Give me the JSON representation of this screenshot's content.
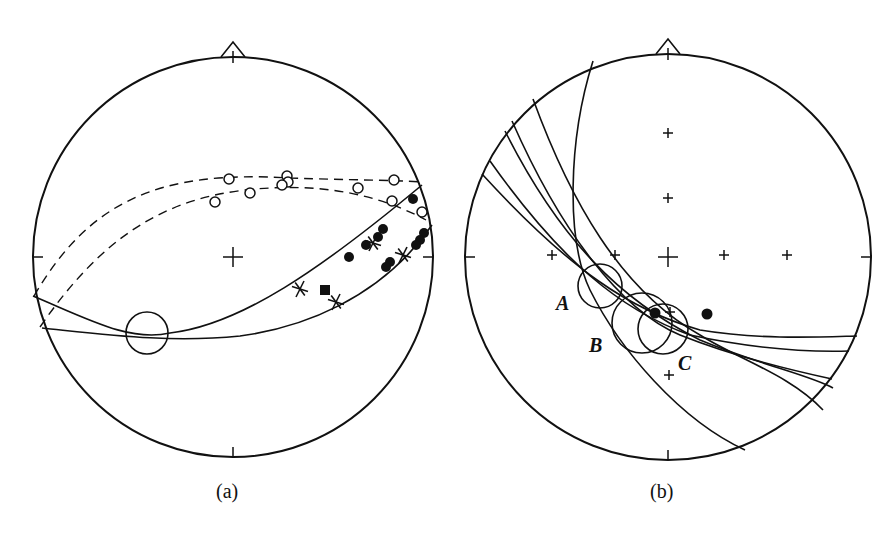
{
  "figure": {
    "panels": [
      {
        "id": "a",
        "caption": "(a)",
        "center": [
          233,
          257
        ],
        "radius": 200,
        "ink": "#111111",
        "dashed_great_circles": [
          "M 34 296 C 90 200, 160 170, 290 178 C 350 180, 390 180, 422 182",
          "M 40 327 C 100 240, 160 200, 245 190 C 310 183, 370 190, 426 220"
        ],
        "solid_great_circles": [
          "M 33 296 C 90 320, 130 342, 170 333 C 240 325, 320 270, 422 185",
          "M 42 328 C 110 335, 170 343, 240 336 C 300 328, 380 300, 432 225"
        ],
        "open_circles": [
          [
            229,
            179
          ],
          [
            287,
            176
          ],
          [
            288,
            182
          ],
          [
            394,
            180
          ],
          [
            215,
            202
          ],
          [
            250,
            193
          ],
          [
            282,
            185
          ],
          [
            358,
            188
          ],
          [
            392,
            201
          ],
          [
            422,
            212
          ]
        ],
        "filled_circles": [
          [
            413,
            199
          ],
          [
            383,
            229
          ],
          [
            378,
            237
          ],
          [
            366,
            245
          ],
          [
            349,
            257
          ],
          [
            424,
            233
          ],
          [
            420,
            240
          ],
          [
            390,
            262
          ],
          [
            386,
            267
          ],
          [
            416,
            245
          ]
        ],
        "stars": [
          [
            373,
            243
          ],
          [
            403,
            255
          ],
          [
            300,
            289
          ],
          [
            336,
            302
          ]
        ],
        "filled_squares": [
          [
            325,
            290
          ]
        ],
        "confidence_circle": {
          "cx": 147,
          "cy": 333,
          "r": 21
        }
      },
      {
        "id": "b",
        "caption": "(b)",
        "center": [
          668,
          257
        ],
        "radius": 203,
        "ink": "#111111",
        "great_circles": [
          "M 593 61 C 568 140, 566 240, 590 290 C 620 350, 680 420, 745 450",
          "M 533 99 C 570 200, 620 290, 700 335 C 740 360, 790 375, 823 410",
          "M 512 121 C 560 230, 620 310, 680 335 C 730 355, 790 370, 832 379",
          "M 505 131 C 560 240, 620 300, 700 340 C 760 365, 810 375, 833 388",
          "M 490 161 C 560 260, 620 310, 690 335 C 760 350, 815 352, 849 351",
          "M 482 174 C 570 270, 630 310, 700 330 C 760 340, 820 337, 857 336"
        ],
        "dispersed_circles": [
          {
            "cx": 600,
            "cy": 286,
            "r": 22
          },
          {
            "cx": 642,
            "cy": 323,
            "r": 30
          },
          {
            "cx": 663,
            "cy": 329,
            "r": 25
          }
        ],
        "filled_circles": [
          [
            655,
            313
          ],
          [
            707,
            314
          ]
        ],
        "plus_markers": [
          [
            668,
            133
          ],
          [
            668,
            198
          ],
          [
            615,
            255
          ],
          [
            552,
            255
          ],
          [
            724,
            255
          ],
          [
            787,
            255
          ],
          [
            670,
            312
          ],
          [
            669,
            375
          ]
        ],
        "center_cross": [
          668,
          257
        ],
        "labels": [
          {
            "text": "A",
            "x": 556,
            "y": 310
          },
          {
            "text": "B",
            "x": 589,
            "y": 352
          },
          {
            "text": "C",
            "x": 678,
            "y": 370
          }
        ]
      }
    ]
  }
}
